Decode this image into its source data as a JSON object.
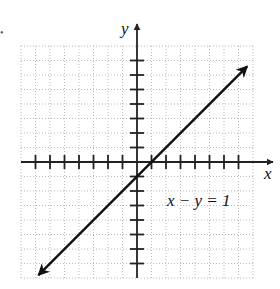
{
  "chart_data": {
    "type": "line",
    "title": "",
    "xlabel": "x",
    "ylabel": "y",
    "xlim": [
      -8,
      8
    ],
    "ylim": [
      -8,
      8
    ],
    "grid": true,
    "tick_step": 1,
    "series": [
      {
        "name": "x − y = 1",
        "equation": "y = x - 1",
        "x": [
          -6.8,
          0,
          1,
          7.6
        ],
        "values": [
          -7.8,
          -1,
          0,
          6.6
        ],
        "arrows": "both"
      }
    ],
    "annotations": [
      {
        "text": "x − y = 1",
        "x": 3.3,
        "y": -1.8
      }
    ],
    "colors": {
      "line": "#111111",
      "grid": "#bbbbbb",
      "axes": "#222222"
    }
  },
  "labels": {
    "x_axis": "x",
    "y_axis": "y",
    "equation": "x − y = 1",
    "marker": "•"
  }
}
